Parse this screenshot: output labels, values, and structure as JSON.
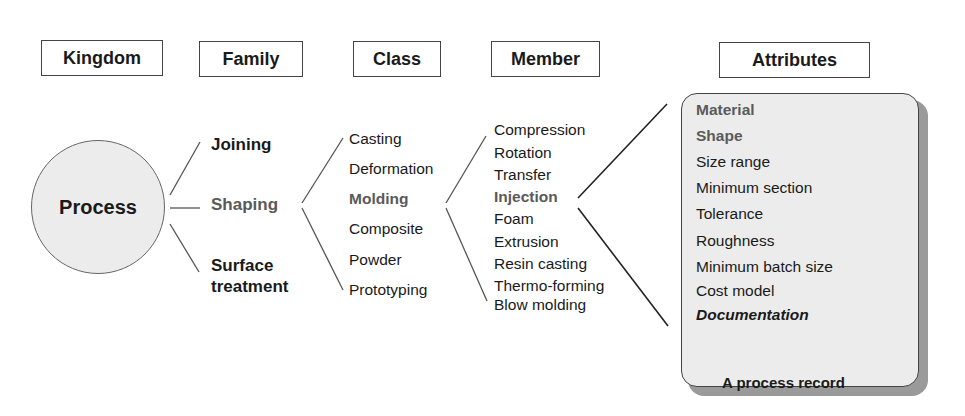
{
  "headers": {
    "kingdom": "Kingdom",
    "family": "Family",
    "class": "Class",
    "member": "Member",
    "attributes": "Attributes"
  },
  "kingdom": {
    "label": "Process"
  },
  "families": [
    {
      "label": "Joining",
      "style": "bold"
    },
    {
      "label": "Shaping",
      "style": "bold-grey"
    },
    {
      "label": "Surface\ntreatment",
      "line1": "Surface",
      "line2": "treatment",
      "style": "bold"
    }
  ],
  "classes": [
    {
      "label": "Casting"
    },
    {
      "label": "Deformation"
    },
    {
      "label": "Molding",
      "highlight": true
    },
    {
      "label": "Composite"
    },
    {
      "label": "Powder"
    },
    {
      "label": "Prototyping"
    }
  ],
  "members": [
    {
      "label": "Compression"
    },
    {
      "label": "Rotation"
    },
    {
      "label": "Transfer"
    },
    {
      "label": "Injection",
      "highlight": true
    },
    {
      "label": "Foam"
    },
    {
      "label": "Extrusion"
    },
    {
      "label": "Resin casting"
    },
    {
      "label": "Thermo-forming"
    },
    {
      "label": "Blow molding"
    }
  ],
  "attributes": [
    {
      "label": "Material",
      "style": "bold-grey"
    },
    {
      "label": "Shape",
      "style": "bold-grey"
    },
    {
      "label": "Size range"
    },
    {
      "label": "Minimum section"
    },
    {
      "label": "Tolerance"
    },
    {
      "label": "Roughness"
    },
    {
      "label": "Minimum batch size"
    },
    {
      "label": "Cost model"
    },
    {
      "label": "Documentation",
      "style": "bold-italic"
    }
  ],
  "caption": "A process record",
  "colors": {
    "highlight_text": "#5a5a5a",
    "circle_fill": "#ececec",
    "card_fill": "#ececec",
    "card_shadow": "#9a9a9a"
  }
}
